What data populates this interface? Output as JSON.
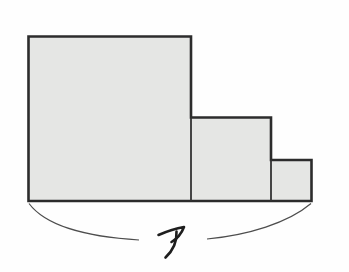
{
  "figure": {
    "type": "composite-rectangle-area-diagram",
    "label": "ア",
    "colors": {
      "background": "#fefefe",
      "shape_fill": "#e5e6e4",
      "shape_outline": "#2c2c2c",
      "internal_edge": "#333333",
      "brace": "#4d4d4d",
      "label_ink": "#1e1e1e"
    },
    "rects": [
      {
        "name": "large-square",
        "x": 28.5,
        "y": 36.5,
        "w": 162.5,
        "h": 164.5
      },
      {
        "name": "medium-square",
        "x": 191,
        "y": 117.5,
        "w": 80,
        "h": 83.5
      },
      {
        "name": "small-square",
        "x": 271,
        "y": 160,
        "w": 40.5,
        "h": 41
      }
    ],
    "outline_points": "28.5,36.5 191,36.5 191,117.5 271,117.5 271,160 311.5,160 311.5,201 28.5,201",
    "internal_edges": [
      {
        "x1": 191,
        "y1": 117.5,
        "x2": 191,
        "y2": 201
      },
      {
        "x1": 271,
        "y1": 160,
        "x2": 271,
        "y2": 201
      }
    ],
    "brace": {
      "left_path": "M 29 203.5 C 45 225, 85 237, 139 240",
      "right_path": "M 207 239 C 248 235, 288 223, 311 203.5",
      "stroke_width": 1.2
    },
    "label_glyph": {
      "stroke1": "M 158.5 235 C 166.5 231.5, 175 228.5, 184 227 C 181.5 233.5, 177.5 238.5, 171.5 242",
      "stroke2": "M 176.5 231.5 C 177 240, 173.5 250, 165.5 257.5",
      "stroke_width": 2.6
    },
    "label_pos": {
      "x": 158,
      "y": 254
    }
  }
}
